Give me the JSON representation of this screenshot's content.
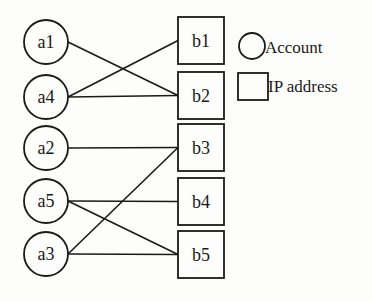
{
  "diagram": {
    "type": "bipartite-graph",
    "accounts": [
      {
        "id": "a1",
        "label": "a1",
        "cx": 46,
        "cy": 42
      },
      {
        "id": "a4",
        "label": "a4",
        "cx": 46,
        "cy": 97
      },
      {
        "id": "a2",
        "label": "a2",
        "cx": 46,
        "cy": 148
      },
      {
        "id": "a5",
        "label": "a5",
        "cx": 46,
        "cy": 201
      },
      {
        "id": "a3",
        "label": "a3",
        "cx": 46,
        "cy": 254
      }
    ],
    "ip_addresses": [
      {
        "id": "b1",
        "label": "b1",
        "x": 178,
        "y": 17
      },
      {
        "id": "b2",
        "label": "b2",
        "x": 178,
        "y": 72
      },
      {
        "id": "b3",
        "label": "b3",
        "x": 178,
        "y": 124
      },
      {
        "id": "b4",
        "label": "b4",
        "x": 178,
        "y": 178
      },
      {
        "id": "b5",
        "label": "b5",
        "x": 178,
        "y": 231
      }
    ],
    "edges": [
      [
        "a1",
        "b2"
      ],
      [
        "a4",
        "b1"
      ],
      [
        "a4",
        "b2"
      ],
      [
        "a2",
        "b3"
      ],
      [
        "a5",
        "b4"
      ],
      [
        "a5",
        "b5"
      ],
      [
        "a3",
        "b3"
      ],
      [
        "a3",
        "b5"
      ]
    ],
    "legend": {
      "account_label": "Account",
      "ip_label": "IP address"
    }
  }
}
